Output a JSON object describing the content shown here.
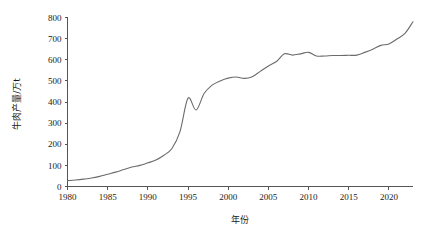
{
  "chart_data": {
    "type": "line",
    "title": "",
    "subtitle": "",
    "xlabel": "年份",
    "ylabel": "牛肉产量/万t",
    "xlim": [
      1980,
      2023
    ],
    "ylim": [
      0,
      800
    ],
    "grid": false,
    "legend": null,
    "legend_position": "none",
    "line_color": "#6b6b6b",
    "axis_color": "#555555",
    "xticks": [
      1980,
      1985,
      1990,
      1995,
      2000,
      2005,
      2010,
      2015,
      2020
    ],
    "xtick_labels": [
      "1980",
      "1985",
      "1990",
      "1995",
      "2000",
      "2005",
      "2010",
      "2015",
      "2020"
    ],
    "yticks": [
      0,
      100,
      200,
      300,
      400,
      500,
      600,
      700,
      800
    ],
    "ytick_labels": [
      "0",
      "100",
      "200",
      "300",
      "400",
      "500",
      "600",
      "700",
      "800"
    ],
    "series": [
      {
        "name": "牛肉产量",
        "x": [
          1980,
          1981,
          1982,
          1983,
          1984,
          1985,
          1986,
          1987,
          1988,
          1989,
          1990,
          1991,
          1992,
          1993,
          1994,
          1995,
          1996,
          1997,
          1998,
          1999,
          2000,
          2001,
          2002,
          2003,
          2004,
          2005,
          2006,
          2007,
          2008,
          2009,
          2010,
          2011,
          2012,
          2013,
          2014,
          2015,
          2016,
          2017,
          2018,
          2019,
          2020,
          2021,
          2022,
          2023
        ],
        "values": [
          28,
          31,
          35,
          40,
          48,
          58,
          68,
          80,
          92,
          100,
          112,
          125,
          148,
          180,
          260,
          418,
          362,
          440,
          480,
          500,
          513,
          518,
          512,
          520,
          545,
          570,
          592,
          628,
          622,
          628,
          635,
          618,
          618,
          620,
          620,
          621,
          622,
          635,
          650,
          668,
          675,
          698,
          725,
          780
        ]
      }
    ]
  },
  "axis": {
    "y_title": "牛肉产量/万t",
    "x_title": "年份"
  }
}
